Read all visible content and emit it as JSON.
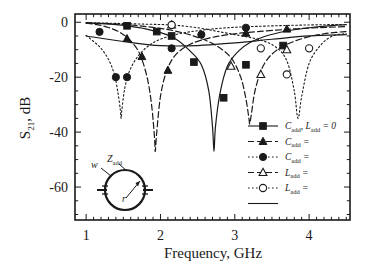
{
  "chart_data": {
    "type": "line",
    "title": "",
    "xlabel": "Frequency, GHz",
    "ylabel": "S21, dB",
    "xlim": [
      0.85,
      4.55
    ],
    "ylim": [
      -72,
      3
    ],
    "xticks": [
      1,
      2,
      3,
      4
    ],
    "yticks": [
      0,
      -20,
      -40,
      -60
    ],
    "xtick_labels": [
      "1",
      "2",
      "3",
      "4"
    ],
    "ytick_labels": [
      "0",
      "-20",
      "-40",
      "-60"
    ],
    "grid": false,
    "legend_position": "lower-right",
    "series": [
      {
        "name": "Cadd, Ladd = 0",
        "marker": "filled-square",
        "linestyle": "solid",
        "notch_freq": 2.72,
        "notch_depth": -47,
        "x": [
          1.0,
          1.2,
          1.4,
          1.6,
          1.8,
          2.0,
          2.2,
          2.4,
          2.55,
          2.65,
          2.7,
          2.72,
          2.74,
          2.8,
          2.9,
          3.05,
          3.2,
          3.4,
          3.7,
          4.0,
          4.3,
          4.5
        ],
        "y": [
          -0.2,
          -0.5,
          -0.9,
          -1.5,
          -2.4,
          -3.8,
          -6.0,
          -10.5,
          -15.5,
          -25.0,
          -38.0,
          -47.0,
          -38.0,
          -26.0,
          -16.0,
          -10.5,
          -7.5,
          -5.2,
          -3.2,
          -2.0,
          -1.2,
          -0.9
        ],
        "markers_x": [
          1.55,
          1.95,
          2.15,
          2.45,
          2.85,
          3.15,
          3.65
        ],
        "markers_y": [
          -1.3,
          -3.4,
          -5.0,
          -14.5,
          -27.5,
          -15.5,
          -8.5
        ]
      },
      {
        "name": "Cadd =",
        "marker": "filled-triangle",
        "linestyle": "dashed",
        "notch_freq": 1.93,
        "notch_depth": -47,
        "x": [
          1.0,
          1.15,
          1.3,
          1.45,
          1.6,
          1.72,
          1.82,
          1.88,
          1.92,
          1.93,
          1.95,
          2.0,
          2.08,
          2.2,
          2.4,
          2.7,
          3.0,
          3.3,
          3.7,
          4.1,
          4.4,
          4.5
        ],
        "y": [
          -0.3,
          -0.9,
          -1.9,
          -3.6,
          -6.8,
          -11.5,
          -20.0,
          -30.0,
          -42.0,
          -47.0,
          -40.0,
          -27.0,
          -18.0,
          -12.0,
          -8.0,
          -5.5,
          -4.2,
          -3.4,
          -2.6,
          -2.0,
          -1.7,
          -1.6
        ],
        "markers_x": [
          1.55,
          1.75,
          2.1,
          3.15,
          3.7
        ],
        "markers_y": [
          -6.0,
          -12.5,
          -17.5,
          -4.0,
          -2.5
        ]
      },
      {
        "name": "Cadd =",
        "marker": "filled-circle",
        "linestyle": "dotted",
        "notch_freq": 1.47,
        "notch_depth": -35,
        "x": [
          1.0,
          1.1,
          1.2,
          1.3,
          1.38,
          1.43,
          1.46,
          1.47,
          1.48,
          1.52,
          1.58,
          1.68,
          1.82,
          2.0,
          2.25,
          2.55,
          2.9,
          3.3,
          3.8,
          4.2,
          4.5
        ],
        "y": [
          -4.8,
          -7.0,
          -9.5,
          -13.5,
          -19.0,
          -26.0,
          -32.0,
          -35.0,
          -32.0,
          -24.0,
          -18.0,
          -13.0,
          -9.0,
          -6.2,
          -4.2,
          -2.9,
          -2.0,
          -1.5,
          -1.1,
          -0.9,
          -0.8
        ],
        "markers_x": [
          1.18,
          1.4,
          1.55,
          2.15,
          2.55,
          3.15
        ],
        "markers_y": [
          -3.5,
          -20.0,
          -20.0,
          -9.5,
          -4.5,
          -2.0
        ]
      },
      {
        "name": "Ladd =",
        "marker": "open-triangle",
        "linestyle": "dashed",
        "notch_freq": 3.2,
        "notch_depth": -37,
        "x": [
          1.0,
          1.3,
          1.6,
          1.9,
          2.2,
          2.5,
          2.75,
          2.95,
          3.08,
          3.15,
          3.19,
          3.2,
          3.22,
          3.28,
          3.4,
          3.6,
          3.9,
          4.2,
          4.4,
          4.5
        ],
        "y": [
          -0.2,
          -0.5,
          -1.0,
          -1.9,
          -3.2,
          -5.5,
          -8.5,
          -13.0,
          -20.0,
          -28.0,
          -35.0,
          -37.0,
          -34.0,
          -24.0,
          -15.0,
          -9.5,
          -6.0,
          -4.2,
          -3.6,
          -3.4
        ],
        "markers_x": [
          2.15,
          2.95,
          3.35,
          3.7
        ],
        "markers_y": [
          -1.0,
          -16.0,
          -19.0,
          -10.0
        ]
      },
      {
        "name": "Ladd =",
        "marker": "open-circle",
        "linestyle": "dotted",
        "notch_freq": 3.85,
        "notch_depth": -35,
        "x": [
          1.0,
          1.4,
          1.8,
          2.15,
          2.5,
          2.8,
          3.1,
          3.35,
          3.55,
          3.7,
          3.8,
          3.85,
          3.9,
          4.0,
          4.15,
          4.3,
          4.45,
          4.5
        ],
        "y": [
          -0.2,
          -0.4,
          -0.7,
          -1.0,
          -2.0,
          -3.5,
          -5.0,
          -6.5,
          -9.0,
          -14.0,
          -25.0,
          -35.0,
          -27.0,
          -15.0,
          -8.5,
          -5.2,
          -4.3,
          -4.2
        ],
        "markers_x": [
          2.15,
          3.35,
          3.7,
          4.0
        ],
        "markers_y": [
          -1.0,
          -9.5,
          -19.0,
          -9.5
        ]
      },
      {
        "name": "",
        "marker": "none",
        "linestyle": "solid",
        "notch_freq": null,
        "notch_depth": null,
        "x": [
          1.0,
          1.5,
          2.0,
          2.5,
          3.0,
          3.5,
          4.0,
          4.5
        ],
        "y": [
          -5.0,
          -7.0,
          -8.5,
          -8.5,
          -7.5,
          -6.2,
          -5.0,
          -4.5
        ],
        "markers_x": [],
        "markers_y": []
      }
    ],
    "legend": [
      {
        "label_main": "C",
        "label_sub": "add",
        "label_rest": ", ",
        "label_main2": "L",
        "label_sub2": "add",
        "label_rest2": " = 0",
        "marker": "filled-square",
        "linestyle": "solid"
      },
      {
        "label_main": "C",
        "label_sub": "add",
        "label_rest": " =",
        "marker": "filled-triangle",
        "linestyle": "dashed"
      },
      {
        "label_main": "C",
        "label_sub": "add",
        "label_rest": " =",
        "marker": "filled-circle",
        "linestyle": "dotted"
      },
      {
        "label_main": "L",
        "label_sub": "add",
        "label_rest": " =",
        "marker": "open-triangle",
        "linestyle": "dashed"
      },
      {
        "label_main": "L",
        "label_sub": "add",
        "label_rest": " =",
        "marker": "open-circle",
        "linestyle": "dotted"
      },
      {
        "label_main": "",
        "label_sub": "",
        "label_rest": "",
        "marker": "none",
        "linestyle": "solid"
      }
    ],
    "annotations": {
      "inset_z": "Z",
      "inset_z_sub": "add",
      "inset_w": "w",
      "inset_r": "r"
    }
  },
  "axis": {
    "ylabel_main": "S",
    "ylabel_sub": "21",
    "ylabel_rest": ", dB",
    "xlabel": "Frequency, GHz"
  },
  "colors": {
    "line": "#1a1a1a",
    "background": "#ffffff",
    "frame": "#1a1a1a"
  }
}
